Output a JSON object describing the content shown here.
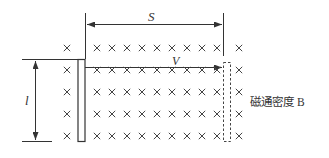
{
  "diagram": {
    "labels": {
      "distance": "S",
      "velocity": "V",
      "length": "l",
      "field": "磁通密度 B"
    },
    "field_symbol": "×",
    "rows_y": [
      48,
      70,
      92,
      114,
      136
    ],
    "cross_columns_x": [
      67,
      97,
      112,
      127,
      142,
      157,
      172,
      187,
      202,
      217,
      239
    ],
    "colors": {
      "line": "#333333",
      "cross": "#444444",
      "background": "#ffffff"
    }
  }
}
